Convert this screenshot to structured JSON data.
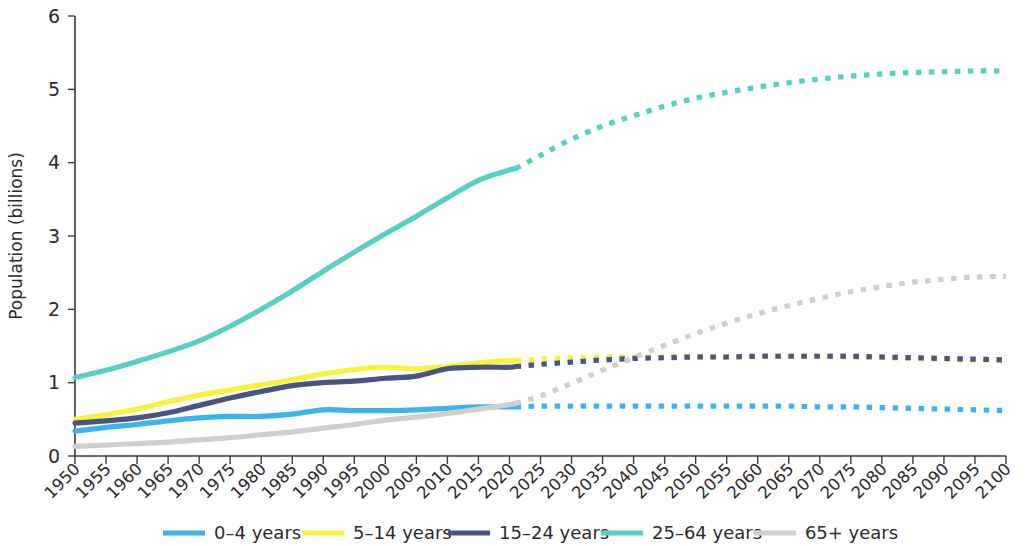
{
  "chart_data": {
    "type": "line",
    "title": "",
    "xlabel": "",
    "ylabel": "Population (billions)",
    "xlim": [
      1950,
      2100
    ],
    "ylim": [
      0,
      6
    ],
    "yticks": [
      0,
      1,
      2,
      3,
      4,
      5,
      6
    ],
    "ytick_labels": [
      "0",
      "1",
      "2",
      "3",
      "4",
      "5",
      "6"
    ],
    "grid": false,
    "legend_position": "bottom",
    "projection_start_year": 2021,
    "projection_note": "solid lines are historical estimates; dotted lines are projections",
    "x": [
      1950,
      1955,
      1960,
      1965,
      1970,
      1975,
      1980,
      1985,
      1990,
      1995,
      2000,
      2005,
      2010,
      2015,
      2020,
      2021,
      2025,
      2030,
      2035,
      2040,
      2045,
      2050,
      2055,
      2060,
      2065,
      2070,
      2075,
      2080,
      2085,
      2090,
      2095,
      2100
    ],
    "xtick_labels": [
      "1950",
      "1955",
      "1960",
      "1965",
      "1970",
      "1975",
      "1980",
      "1985",
      "1990",
      "1995",
      "2000",
      "2005",
      "2010",
      "2015",
      "2020",
      "2025",
      "2030",
      "2035",
      "2040",
      "2045",
      "2050",
      "2055",
      "2060",
      "2065",
      "2070",
      "2075",
      "2080",
      "2085",
      "2090",
      "2095",
      "2100"
    ],
    "series": [
      {
        "name": "0–4 years",
        "color": "#3ab4ef",
        "values": [
          0.34,
          0.39,
          0.43,
          0.48,
          0.52,
          0.54,
          0.54,
          0.57,
          0.63,
          0.62,
          0.62,
          0.63,
          0.65,
          0.67,
          0.67,
          0.67,
          0.68,
          0.68,
          0.68,
          0.68,
          0.68,
          0.68,
          0.68,
          0.68,
          0.68,
          0.67,
          0.67,
          0.66,
          0.65,
          0.64,
          0.63,
          0.62
        ]
      },
      {
        "name": "5–14 years",
        "color": "#f6f33f",
        "values": [
          0.5,
          0.56,
          0.64,
          0.74,
          0.83,
          0.9,
          0.97,
          1.04,
          1.12,
          1.18,
          1.21,
          1.19,
          1.22,
          1.27,
          1.3,
          1.3,
          1.32,
          1.34,
          1.35,
          1.35,
          1.35,
          1.35,
          1.35,
          1.36,
          1.36,
          1.36,
          1.35,
          1.34,
          1.33,
          1.32,
          1.31,
          1.3
        ]
      },
      {
        "name": "15–24 years",
        "color": "#4a5480",
        "values": [
          0.45,
          0.48,
          0.52,
          0.59,
          0.69,
          0.79,
          0.88,
          0.96,
          1.0,
          1.02,
          1.06,
          1.09,
          1.19,
          1.21,
          1.21,
          1.22,
          1.25,
          1.28,
          1.31,
          1.33,
          1.34,
          1.35,
          1.35,
          1.36,
          1.36,
          1.36,
          1.36,
          1.35,
          1.34,
          1.33,
          1.32,
          1.31
        ]
      },
      {
        "name": "25–64 years",
        "color": "#57cfc3",
        "values": [
          1.07,
          1.17,
          1.29,
          1.42,
          1.57,
          1.77,
          2.0,
          2.25,
          2.52,
          2.78,
          3.03,
          3.27,
          3.52,
          3.76,
          3.9,
          3.92,
          4.1,
          4.32,
          4.5,
          4.64,
          4.77,
          4.88,
          4.96,
          5.03,
          5.09,
          5.14,
          5.18,
          5.21,
          5.23,
          5.24,
          5.25,
          5.25
        ]
      },
      {
        "name": "65+ years",
        "color": "#cfcfcf",
        "values": [
          0.13,
          0.15,
          0.17,
          0.19,
          0.22,
          0.25,
          0.29,
          0.33,
          0.38,
          0.43,
          0.49,
          0.53,
          0.58,
          0.64,
          0.7,
          0.72,
          0.82,
          0.99,
          1.17,
          1.34,
          1.51,
          1.67,
          1.81,
          1.94,
          2.05,
          2.15,
          2.24,
          2.31,
          2.37,
          2.41,
          2.44,
          2.45
        ]
      }
    ]
  },
  "legend": {
    "items": [
      {
        "label": "0–4 years",
        "color": "#3ab4ef"
      },
      {
        "label": "5–14 years",
        "color": "#f6f33f"
      },
      {
        "label": "15–24 years",
        "color": "#4a5480"
      },
      {
        "label": "25–64 years",
        "color": "#57cfc3"
      },
      {
        "label": "65+ years",
        "color": "#cfcfcf"
      }
    ]
  }
}
